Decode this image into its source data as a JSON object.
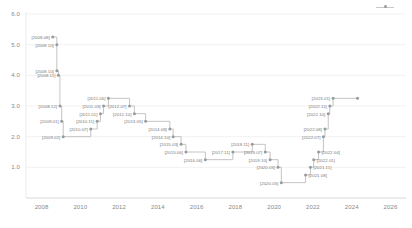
{
  "chart_data": {
    "type": "line",
    "title": "",
    "subtitle": "",
    "xlabel": "",
    "ylabel": "",
    "xlim": [
      2007.2,
      2026.8
    ],
    "ylim": [
      0.0,
      6.0
    ],
    "grid": true,
    "legend_position": "top-right",
    "step_style": "hv",
    "xtick_labels": [
      "2008",
      "2010",
      "2012",
      "2014",
      "2016",
      "2018",
      "2020",
      "2022",
      "2024",
      "2026"
    ],
    "xtick_values": [
      2008,
      2010,
      2012,
      2014,
      2016,
      2018,
      2020,
      2022,
      2024,
      2026
    ],
    "ytick_labels": [
      "0.0",
      "1.0",
      "2.0",
      "3.0",
      "4.0",
      "5.0",
      "6.0"
    ],
    "ytick_values": [
      0.0,
      1.0,
      2.0,
      3.0,
      4.0,
      5.0,
      6.0
    ],
    "series": [
      {
        "name": "rate",
        "color": "#bdbdbd",
        "marker_color": "#9a9a9a",
        "points": [
          {
            "label": "[2008.08]",
            "x": 2008.58,
            "y": 5.25,
            "label_side": "left"
          },
          {
            "label": "[2008.10]",
            "x": 2008.79,
            "y": 5.0,
            "label_side": "left"
          },
          {
            "label": "[2008.10]",
            "x": 2008.79,
            "y": 4.15,
            "label_side": "left"
          },
          {
            "label": "[2008.11]",
            "x": 2008.87,
            "y": 4.0,
            "label_side": "left"
          },
          {
            "label": "[2008.12]",
            "x": 2008.95,
            "y": 3.0,
            "label_side": "left"
          },
          {
            "label": "[2009.01]",
            "x": 2009.04,
            "y": 2.5,
            "label_side": "left"
          },
          {
            "label": "[2009.02]",
            "x": 2009.12,
            "y": 2.0,
            "label_side": "left"
          },
          {
            "label": "[2010.07]",
            "x": 2010.54,
            "y": 2.25,
            "label_side": "left"
          },
          {
            "label": "[2010.11]",
            "x": 2010.87,
            "y": 2.5,
            "label_side": "left"
          },
          {
            "label": "[2011.01]",
            "x": 2011.04,
            "y": 2.75,
            "label_side": "left"
          },
          {
            "label": "[2011.03]",
            "x": 2011.2,
            "y": 3.0,
            "label_side": "left"
          },
          {
            "label": "[2011.06]",
            "x": 2011.45,
            "y": 3.25,
            "label_side": "left"
          },
          {
            "label": "[2012.07]",
            "x": 2012.54,
            "y": 3.0,
            "label_side": "left"
          },
          {
            "label": "[2012.10]",
            "x": 2012.79,
            "y": 2.75,
            "label_side": "left"
          },
          {
            "label": "[2013.05]",
            "x": 2013.37,
            "y": 2.5,
            "label_side": "left"
          },
          {
            "label": "[2014.08]",
            "x": 2014.62,
            "y": 2.25,
            "label_side": "left"
          },
          {
            "label": "[2014.10]",
            "x": 2014.79,
            "y": 2.0,
            "label_side": "left"
          },
          {
            "label": "[2015.03]",
            "x": 2015.2,
            "y": 1.75,
            "label_side": "left"
          },
          {
            "label": "[2015.06]",
            "x": 2015.45,
            "y": 1.5,
            "label_side": "left"
          },
          {
            "label": "[2016.06]",
            "x": 2016.45,
            "y": 1.25,
            "label_side": "left"
          },
          {
            "label": "[2017.11]",
            "x": 2017.87,
            "y": 1.5,
            "label_side": "left"
          },
          {
            "label": "[2018.11]",
            "x": 2018.87,
            "y": 1.75,
            "label_side": "left"
          },
          {
            "label": "[2019.07]",
            "x": 2019.54,
            "y": 1.5,
            "label_side": "left"
          },
          {
            "label": "[2019.10]",
            "x": 2019.79,
            "y": 1.25,
            "label_side": "left"
          },
          {
            "label": "[2020.03]",
            "x": 2020.2,
            "y": 1.0,
            "label_side": "left"
          },
          {
            "label": "[2020.05]",
            "x": 2020.37,
            "y": 0.5,
            "label_side": "left"
          },
          {
            "label": "[2021.08]",
            "x": 2021.62,
            "y": 0.75,
            "label_side": "right"
          },
          {
            "label": "[2021.11]",
            "x": 2021.87,
            "y": 1.0,
            "label_side": "right"
          },
          {
            "label": "[2022.01]",
            "x": 2022.04,
            "y": 1.25,
            "label_side": "right"
          },
          {
            "label": "[2022.04]",
            "x": 2022.29,
            "y": 1.5,
            "label_side": "right"
          },
          {
            "label": "[2022.07]",
            "x": 2022.54,
            "y": 2.0,
            "label_side": "left"
          },
          {
            "label": "[2022.08]",
            "x": 2022.62,
            "y": 2.25,
            "label_side": "left"
          },
          {
            "label": "[2022.10]",
            "x": 2022.79,
            "y": 2.75,
            "label_side": "left"
          },
          {
            "label": "[2022.11]",
            "x": 2022.87,
            "y": 3.0,
            "label_side": "left"
          },
          {
            "label": "[2023.01]",
            "x": 2023.04,
            "y": 3.25,
            "label_side": "left"
          },
          {
            "label": "",
            "x": 2024.3,
            "y": 3.25,
            "label_side": "none"
          }
        ]
      }
    ]
  },
  "legend": {
    "entries": [
      {
        "label": "",
        "icon": "line-marker-icon",
        "color": "#bdbdbd"
      }
    ]
  }
}
